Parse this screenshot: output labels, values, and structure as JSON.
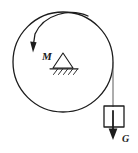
{
  "figure": {
    "name": "rotating-disk-with-hanging-weight",
    "background_color": "#ffffff",
    "stroke_color": "#1c1c1c",
    "width": 138,
    "height": 153,
    "labels": {
      "moment": "M",
      "weight": "G"
    },
    "disk": {
      "name": "disk",
      "center_x": 63,
      "center_y": 62,
      "radius": 50,
      "stroke_width": 1.3
    },
    "moment_arrow": {
      "name": "moment-arrow",
      "direction": "counterclockwise",
      "label": "M",
      "label_x": 42,
      "label_y": 60,
      "label_size": 11,
      "path": "M 88 16 C 70 8, 44 14, 35 34 L 33.5 44",
      "head": "33.0,52.5 30.2,41.4 36.6,42.2",
      "stroke_width": 1.3
    },
    "pivot": {
      "name": "pin-support",
      "apex_x": 63,
      "apex_y": 53,
      "base_left_x": 53,
      "base_right_x": 73,
      "base_y": 68,
      "ground_left_x": 50,
      "ground_right_x": 78,
      "ground_y": 68.8,
      "hatch_count": 5,
      "stroke_width": 1.1
    },
    "rope": {
      "name": "rope",
      "x": 113,
      "top_y": 62,
      "bottom_y": 107,
      "stroke_width": 1.0,
      "color": "#5a5a5a"
    },
    "weight_block": {
      "name": "weight-block",
      "x": 104,
      "y": 106,
      "width": 20,
      "height": 21,
      "stroke_width": 1.3
    },
    "weight_arrow": {
      "name": "weight-force-arrow",
      "direction": "down",
      "label": "G",
      "label_x": 122,
      "label_y": 142,
      "label_size": 10,
      "x": 113,
      "top_y": 111,
      "bottom_y": 132,
      "head": "113,140 108.6,128.5 117.4,128.5",
      "stroke_width": 1.8
    }
  }
}
